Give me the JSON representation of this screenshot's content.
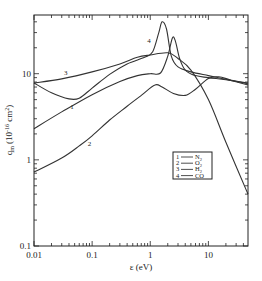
{
  "chart_data": {
    "type": "line",
    "title": "",
    "xlabel": "ε (eV)",
    "ylabel": "q_m (10^-16 cm^2)",
    "xscale": "log",
    "yscale": "log",
    "xlim": [
      0.01,
      48
    ],
    "ylim": [
      0.1,
      48
    ],
    "x_ticks": [
      {
        "value": 0.01,
        "label": "0.01"
      },
      {
        "value": 0.1,
        "label": "0.1"
      },
      {
        "value": 1,
        "label": "1"
      },
      {
        "value": 10,
        "label": "10"
      }
    ],
    "y_ticks": [
      {
        "value": 0.1,
        "label": "0.1"
      },
      {
        "value": 1,
        "label": "1"
      },
      {
        "value": 10,
        "label": "10"
      }
    ],
    "grid": false,
    "legend_position": "inside lower right",
    "series": [
      {
        "id": "1",
        "name": "N2",
        "legend_label": "1 — N₂",
        "points": [
          [
            0.01,
            2.3
          ],
          [
            0.03,
            3.6
          ],
          [
            0.1,
            5.7
          ],
          [
            0.3,
            8.1
          ],
          [
            0.6,
            9.5
          ],
          [
            1,
            10
          ],
          [
            1.5,
            10.2
          ],
          [
            2,
            16
          ],
          [
            2.4,
            26
          ],
          [
            2.7,
            24
          ],
          [
            3.2,
            15
          ],
          [
            4,
            11
          ],
          [
            6,
            9.5
          ],
          [
            10,
            9
          ],
          [
            20,
            8.5
          ],
          [
            48,
            7.8
          ]
        ]
      },
      {
        "id": "2",
        "name": "O2",
        "legend_label": "2 — O₂",
        "points": [
          [
            0.01,
            0.72
          ],
          [
            0.03,
            1.05
          ],
          [
            0.06,
            1.45
          ],
          [
            0.1,
            1.9
          ],
          [
            0.2,
            2.9
          ],
          [
            0.4,
            4.2
          ],
          [
            0.7,
            5.6
          ],
          [
            1.2,
            7.4
          ],
          [
            1.6,
            7.0
          ],
          [
            2.5,
            5.9
          ],
          [
            4,
            5.6
          ],
          [
            6,
            6.6
          ],
          [
            10,
            8.8
          ],
          [
            15,
            9.2
          ],
          [
            25,
            8.4
          ],
          [
            48,
            7.6
          ]
        ]
      },
      {
        "id": "3",
        "name": "H2",
        "legend_label": "3 — H₂",
        "points": [
          [
            0.01,
            7.8
          ],
          [
            0.03,
            8.7
          ],
          [
            0.1,
            10.5
          ],
          [
            0.3,
            13
          ],
          [
            0.6,
            15.5
          ],
          [
            1,
            16.5
          ],
          [
            2,
            17.5
          ],
          [
            3,
            15
          ],
          [
            5,
            11
          ],
          [
            10,
            5
          ],
          [
            20,
            1.6
          ],
          [
            48,
            0.4
          ]
        ]
      },
      {
        "id": "4",
        "name": "CO",
        "legend_label": "4 — CO",
        "points": [
          [
            0.01,
            7.8
          ],
          [
            0.02,
            6
          ],
          [
            0.04,
            5.1
          ],
          [
            0.06,
            5.2
          ],
          [
            0.1,
            6.8
          ],
          [
            0.2,
            9.8
          ],
          [
            0.4,
            13
          ],
          [
            0.8,
            15.5
          ],
          [
            1.1,
            18
          ],
          [
            1.4,
            30
          ],
          [
            1.6,
            40
          ],
          [
            1.9,
            33
          ],
          [
            2.3,
            16
          ],
          [
            3,
            12
          ],
          [
            5,
            10.5
          ],
          [
            10,
            9.5
          ],
          [
            20,
            8.6
          ],
          [
            48,
            7.4
          ]
        ]
      }
    ],
    "annotations": [
      {
        "text": "1",
        "x": 0.045,
        "y": 3.9
      },
      {
        "text": "2",
        "x": 0.09,
        "y": 1.45
      },
      {
        "text": "3",
        "x": 0.035,
        "y": 9.6
      },
      {
        "text": "4",
        "x": 0.95,
        "y": 23
      }
    ]
  },
  "axes": {
    "x_title": "ε (eV)",
    "y_title_main": "q",
    "y_title_sub": "m",
    "y_title_unit": "(10",
    "y_title_exp": "-16",
    "y_title_cm": " cm",
    "y_title_cm_exp": "2",
    "y_title_close": ")"
  },
  "legend": {
    "items": [
      {
        "num": "1",
        "dash": "—",
        "label": "N",
        "sub": "2"
      },
      {
        "num": "2",
        "dash": "—",
        "label": "O",
        "sub": "2"
      },
      {
        "num": "3",
        "dash": "—",
        "label": "H",
        "sub": "2"
      },
      {
        "num": "4",
        "dash": "—",
        "label": "CO",
        "sub": ""
      }
    ]
  },
  "style": {
    "line_color": "#333333",
    "axis_color": "#222222",
    "background": "#ffffff"
  }
}
